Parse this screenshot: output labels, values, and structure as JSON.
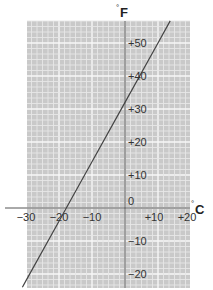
{
  "chart_data": {
    "type": "line",
    "title": "",
    "xlabel": "°C",
    "ylabel": "°F",
    "x_unit_symbol": "C",
    "y_unit_symbol": "F",
    "xlim": [
      -31,
      19.5
    ],
    "ylim": [
      -24,
      56.5
    ],
    "grid": true,
    "x_ticks": [
      -30,
      -20,
      -10,
      10,
      20
    ],
    "x_tick_labels": [
      "−30",
      "−20",
      "−10",
      "+10",
      "+20"
    ],
    "y_ticks": [
      50,
      40,
      30,
      20,
      10,
      0,
      -10,
      -20
    ],
    "y_tick_labels": [
      "+50",
      "+40",
      "+30",
      "+20",
      "+10",
      "0",
      "−10",
      "−20"
    ],
    "series": [
      {
        "name": "Celsius to Fahrenheit",
        "relation": "F = 1.8·C + 32",
        "x": [
          -31.1,
          -30,
          -20,
          -17.8,
          -10,
          0,
          10,
          13.7
        ],
        "y": [
          -24,
          -22,
          -4,
          0,
          14,
          32,
          50,
          56.7
        ]
      }
    ]
  },
  "colors": {
    "grid_background": "#c9c9c9",
    "grid_minor": "#e6e6e6",
    "grid_major": "#f7f7f7",
    "axis": "#555555",
    "line": "#444444",
    "text": "#333333"
  }
}
